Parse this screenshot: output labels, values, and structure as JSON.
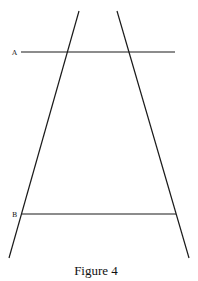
{
  "figure": {
    "caption": "Figure 4",
    "labels": {
      "a": "A",
      "b": "B"
    },
    "lines": {
      "left_diagonal": {
        "x1": 79,
        "y1": 11,
        "x2": 9,
        "y2": 258
      },
      "right_diagonal": {
        "x1": 117,
        "y1": 11,
        "x2": 189,
        "y2": 258
      },
      "line_a": {
        "x1": 21,
        "y1": 52,
        "x2": 175,
        "y2": 52
      },
      "line_b": {
        "x1": 22,
        "y1": 214,
        "x2": 176,
        "y2": 214
      }
    },
    "colors": {
      "stroke": "#1a1a1a",
      "background": "#ffffff"
    }
  }
}
